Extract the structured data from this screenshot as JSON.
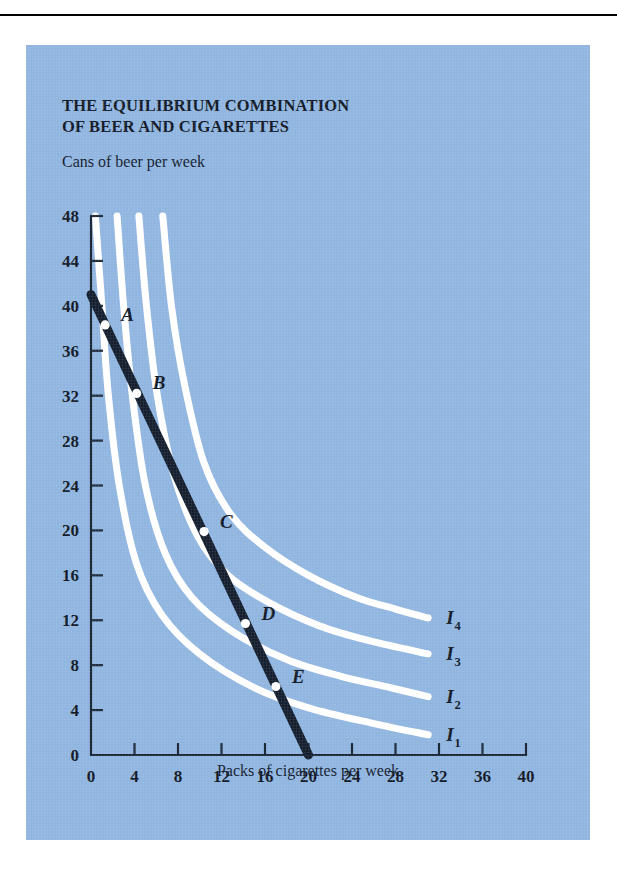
{
  "figure": {
    "title_line1": "THE EQUILIBRIUM COMBINATION",
    "title_line2": "OF BEER AND CIGARETTES",
    "panel_color": "#8FB5E0",
    "curve_color": "#FFFFFF",
    "line_color": "#141E2E",
    "axis_color": "#1A2535"
  },
  "chart_data": {
    "type": "line",
    "title": "THE EQUILIBRIUM COMBINATION OF BEER AND CIGARETTES",
    "xlabel": "Packs of cigarettes per week",
    "ylabel": "Cans of beer per week",
    "xlim": [
      0,
      40
    ],
    "ylim": [
      0,
      48
    ],
    "xticks": [
      0,
      4,
      8,
      12,
      16,
      20,
      24,
      28,
      32,
      36,
      40
    ],
    "yticks": [
      0,
      4,
      8,
      12,
      16,
      20,
      24,
      28,
      32,
      36,
      40,
      44,
      48
    ],
    "grid": false,
    "legend": "inline-right",
    "series": [
      {
        "name": "I1",
        "label": "I",
        "subscript": "1",
        "kind": "indifference-curve",
        "points": [
          [
            0.4,
            48
          ],
          [
            1.0,
            40
          ],
          [
            1.6,
            32
          ],
          [
            2.6,
            24
          ],
          [
            4.2,
            17
          ],
          [
            6.5,
            12.5
          ],
          [
            10,
            9
          ],
          [
            15,
            6
          ],
          [
            20,
            4.2
          ],
          [
            26,
            2.8
          ],
          [
            31,
            1.8
          ]
        ]
      },
      {
        "name": "I2",
        "label": "I",
        "subscript": "2",
        "kind": "indifference-curve",
        "points": [
          [
            2.4,
            48
          ],
          [
            3.0,
            40
          ],
          [
            3.8,
            32
          ],
          [
            5.0,
            24
          ],
          [
            6.8,
            18
          ],
          [
            9.3,
            14
          ],
          [
            13,
            11
          ],
          [
            18,
            8.5
          ],
          [
            23,
            7
          ],
          [
            27.5,
            6
          ],
          [
            31,
            5.2
          ]
        ]
      },
      {
        "name": "I3",
        "label": "I",
        "subscript": "3",
        "kind": "indifference-curve",
        "points": [
          [
            4.4,
            48
          ],
          [
            5.1,
            40
          ],
          [
            6.1,
            32
          ],
          [
            7.6,
            25
          ],
          [
            9.8,
            19.5
          ],
          [
            12.6,
            16
          ],
          [
            16.5,
            13.5
          ],
          [
            21,
            11.5
          ],
          [
            25.5,
            10.2
          ],
          [
            31,
            9
          ]
        ]
      },
      {
        "name": "I4",
        "label": "I",
        "subscript": "4",
        "kind": "indifference-curve",
        "points": [
          [
            6.6,
            48
          ],
          [
            7.4,
            40
          ],
          [
            8.6,
            33
          ],
          [
            10.4,
            26
          ],
          [
            12.8,
            21.5
          ],
          [
            16,
            18.5
          ],
          [
            20,
            16
          ],
          [
            24.5,
            14
          ],
          [
            28,
            13
          ],
          [
            31,
            12.2
          ]
        ]
      },
      {
        "name": "budget-line",
        "label": "Budget line",
        "kind": "budget-line",
        "points": [
          [
            0,
            41
          ],
          [
            20,
            0
          ]
        ]
      }
    ],
    "annotations": [
      {
        "label": "A",
        "x": 1.3,
        "y": 38.3
      },
      {
        "label": "B",
        "x": 4.2,
        "y": 32.2
      },
      {
        "label": "C",
        "x": 10.4,
        "y": 19.9
      },
      {
        "label": "D",
        "x": 14.2,
        "y": 11.7
      },
      {
        "label": "E",
        "x": 17.0,
        "y": 6.1
      }
    ]
  }
}
